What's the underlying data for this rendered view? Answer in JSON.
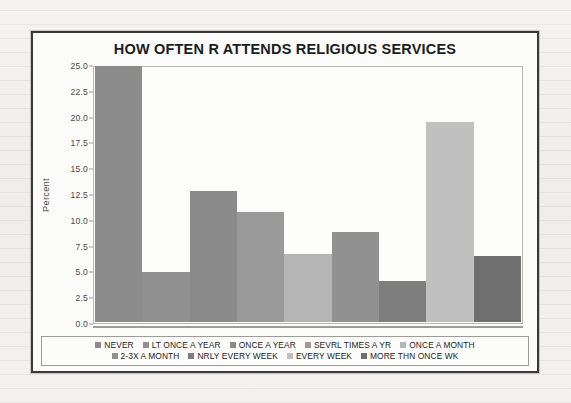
{
  "chart_data": {
    "type": "bar",
    "title": "HOW OFTEN R ATTENDS RELIGIOUS SERVICES",
    "xlabel": "",
    "ylabel": "Percent",
    "ylim": [
      0.0,
      25.0
    ],
    "grid": false,
    "legend_position": "bottom",
    "yticks": [
      "0.0",
      "2.5",
      "5.0",
      "7.5",
      "10.0",
      "12.5",
      "15.0",
      "17.5",
      "20.0",
      "22.5",
      "25.0"
    ],
    "ytick_values": [
      0.0,
      2.5,
      5.0,
      7.5,
      10.0,
      12.5,
      15.0,
      17.5,
      20.0,
      22.5,
      25.0
    ],
    "categories": [
      "NEVER",
      "LT ONCE A YEAR",
      "ONCE A YEAR",
      "SEVRL TIMES A YR",
      "ONCE A MONTH",
      "2-3X A MONTH",
      "NRLY EVERY WEEK",
      "EVERY WEEK",
      "MORE THN ONCE WK"
    ],
    "values": [
      25.2,
      4.9,
      12.9,
      10.8,
      6.7,
      8.9,
      4.0,
      19.7,
      6.5
    ],
    "colors": [
      "#8c8c8c",
      "#909090",
      "#8a8a8a",
      "#9a9a9a",
      "#b5b5b5",
      "#919191",
      "#7e7e7e",
      "#c0c0c0",
      "#6f6f6f"
    ]
  },
  "legend": {
    "rows": [
      [
        {
          "label": "NEVER",
          "color": "#8c8c8c"
        },
        {
          "label": "LT ONCE A YEAR",
          "color": "#909090"
        },
        {
          "label": "ONCE A YEAR",
          "color": "#8a8a8a"
        },
        {
          "label": "SEVRL TIMES A YR",
          "color": "#9a9a9a"
        },
        {
          "label": "ONCE A MONTH",
          "color": "#b5b5b5"
        }
      ],
      [
        {
          "label": "2-3X A MONTH",
          "color": "#919191"
        },
        {
          "label": "NRLY EVERY WEEK",
          "color": "#7e7e7e"
        },
        {
          "label": "EVERY WEEK",
          "color": "#c0c0c0"
        },
        {
          "label": "MORE THN ONCE WK",
          "color": "#6f6f6f"
        }
      ]
    ]
  }
}
